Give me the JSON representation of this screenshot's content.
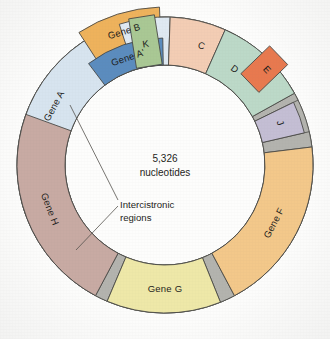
{
  "figure": {
    "kind": "circular-genome-map",
    "organism_note": "",
    "center": {
      "line1": "5,326",
      "line2": "nucleotides"
    },
    "annotation": {
      "line1": "Intercistronic",
      "line2": "regions",
      "leader_count": 2
    },
    "geometry": {
      "cx": 165,
      "cy": 165,
      "r_outer": 148,
      "r_inner": 100,
      "stroke": "#4a4a46"
    },
    "background": "#fdfdfc"
  },
  "chart_data": {
    "type": "pie",
    "total_label": "5,326 nucleotides",
    "units": "degrees of circle",
    "categories": [
      "Gene A",
      "Gene B",
      "K",
      "C",
      "D",
      "E",
      "J",
      "Gene F",
      "Gene G",
      "Gene H"
    ],
    "values": [
      86,
      35,
      17,
      22,
      37,
      22,
      13,
      92,
      50,
      91
    ],
    "legend_position": "in-place labels"
  },
  "segments": [
    {
      "id": "gene-a",
      "label": "Gene A",
      "color": "#d7e4ef",
      "start": -104,
      "end": -18,
      "r_in": 100,
      "r_out": 148,
      "label_angle": -62,
      "label_radius": 125,
      "label_size": "normal"
    },
    {
      "id": "gene-b",
      "label": "Gene B",
      "color": "#eeb25c",
      "start": -33,
      "end": -2,
      "r_in": 119,
      "r_out": 158,
      "label_angle": -17,
      "label_radius": 139,
      "label_size": "normal"
    },
    {
      "id": "gene-b-tail",
      "label": "",
      "color": "#dfe9f2",
      "start": -18,
      "end": 2,
      "r_in": 100,
      "r_out": 148,
      "label_angle": 0,
      "label_radius": 124,
      "label_size": "normal"
    },
    {
      "id": "gene-c",
      "label": "C",
      "color": "#f3cdb4",
      "start": 2,
      "end": 24,
      "r_in": 100,
      "r_out": 148,
      "label_angle": 17,
      "label_radius": 124,
      "label_size": "normal"
    },
    {
      "id": "gene-d",
      "label": "D",
      "color": "#bcd9c8",
      "start": 24,
      "end": 61,
      "r_in": 100,
      "r_out": 148,
      "label_angle": 36,
      "label_radius": 118,
      "label_size": "normal"
    },
    {
      "id": "gene-j",
      "label": "J",
      "color": "#c4bed4",
      "start": 64,
      "end": 77,
      "r_in": 100,
      "r_out": 143,
      "label_angle": 70,
      "label_radius": 122,
      "label_size": "normal"
    },
    {
      "id": "gene-f",
      "label": "Gene F",
      "color": "#f3c88a",
      "start": 83,
      "end": 152,
      "r_in": 100,
      "r_out": 148,
      "label_angle": 118,
      "label_radius": 124,
      "label_size": "normal"
    },
    {
      "id": "gene-g",
      "label": "Gene G",
      "color": "#eee8a8",
      "start": 158,
      "end": 203,
      "r_in": 100,
      "r_out": 148,
      "label_angle": 180,
      "label_radius": 124,
      "label_size": "normal"
    },
    {
      "id": "gene-h",
      "label": "Gene H",
      "color": "#c8aaa3",
      "start": 208,
      "end": 290,
      "r_in": 100,
      "r_out": 148,
      "label_angle": 249,
      "label_radius": 124,
      "label_size": "normal"
    }
  ],
  "overlay_segments": [
    {
      "id": "gene-a-prime",
      "label": "Gene A'",
      "color": "#5b8cbe",
      "start": -37,
      "end": -1,
      "r_in": 100,
      "r_out": 127,
      "label_angle": -19,
      "label_radius": 113,
      "label_fill": "#102030"
    }
  ],
  "boxes": [
    {
      "id": "gene-k",
      "label": "K",
      "color": "#a9c894",
      "angle": -9,
      "r_in": 100,
      "r_out": 150,
      "half_width": 13,
      "label_angle": -9,
      "label_radius": 122
    },
    {
      "id": "gene-e",
      "label": "E",
      "color": "#e8794f",
      "angle": 46,
      "r_in": 118,
      "r_out": 158,
      "half_width": 13,
      "label_angle": 47,
      "label_radius": 139
    }
  ],
  "gaps": [
    {
      "id": "gap-h-a",
      "color": "#b3b3ae",
      "start": 290,
      "end": 256,
      "r_in": 100,
      "r_out": 148
    },
    {
      "id": "gap-d-j",
      "color": "#b3b3ae",
      "start": 61,
      "end": 64,
      "r_in": 100,
      "r_out": 148
    },
    {
      "id": "gap-j-f",
      "color": "#b3b3ae",
      "start": 77,
      "end": 83,
      "r_in": 100,
      "r_out": 148
    },
    {
      "id": "gap-f-g",
      "color": "#b3b3ae",
      "start": 152,
      "end": 158,
      "r_in": 100,
      "r_out": 148
    },
    {
      "id": "gap-g-h",
      "color": "#b3b3ae",
      "start": 203,
      "end": 208,
      "r_in": 100,
      "r_out": 148
    }
  ],
  "gap_list": [
    {
      "id": "gap-h-a-real",
      "color": "#b3b3ae",
      "start": -110,
      "end": -104,
      "r_in": 100,
      "r_out": 148
    }
  ],
  "leaders": [
    {
      "id": "leader-upper",
      "x1": 118,
      "y1": 200,
      "x2": 70,
      "y2": 105
    },
    {
      "id": "leader-lower",
      "x1": 118,
      "y1": 206,
      "x2": 76,
      "y2": 250
    }
  ]
}
